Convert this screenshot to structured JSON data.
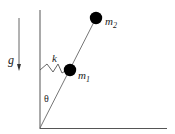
{
  "diagram": {
    "labels": {
      "gravity": "g",
      "spring": "k",
      "angle": "θ",
      "mass1": "m",
      "mass1_sub": "1",
      "mass2": "m",
      "mass2_sub": "2"
    },
    "geometry": {
      "pivot": [
        40,
        128
      ],
      "wall_top": [
        40,
        10
      ],
      "floor_end": [
        167,
        128
      ],
      "m1_center": [
        70,
        70
      ],
      "m2_center": [
        96,
        18
      ],
      "ball_radius": 6,
      "gravity_arrow": {
        "x": 19,
        "y_start": 18,
        "y_end": 70
      }
    },
    "colors": {
      "line": "#555555",
      "ball": "#000000",
      "text": "#222222"
    }
  }
}
